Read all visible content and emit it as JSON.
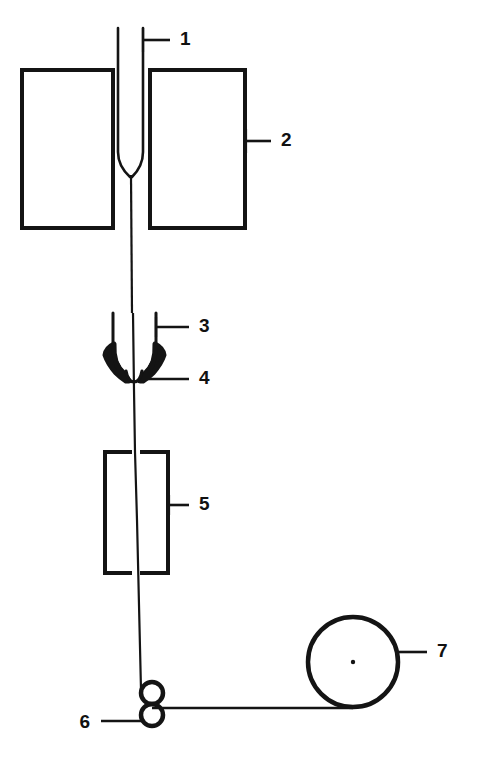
{
  "figure": {
    "background_color": "#ffffff",
    "stroke_color": "#141414",
    "fill_color": "#141414",
    "width": 477,
    "height": 763
  },
  "callouts": [
    {
      "id": "callout-1",
      "label": "1",
      "name": "spinneret-capillary-callout",
      "text_x": 180,
      "text_y": 40,
      "leader_x1": 143,
      "leader_y1": 40,
      "leader_x2": 170,
      "leader_y2": 40,
      "tick_x": 143,
      "tick_y1": 28,
      "tick_y2": 52,
      "has_tick": true
    },
    {
      "id": "callout-2",
      "label": "2",
      "name": "heated-block-callout",
      "text_x": 281,
      "text_y": 141,
      "leader_x1": 246,
      "leader_y1": 141,
      "leader_x2": 271,
      "leader_y2": 141,
      "tick_x": 246,
      "tick_y1": 129,
      "tick_y2": 153,
      "has_tick": true
    },
    {
      "id": "callout-3",
      "label": "3",
      "name": "quench-guide-callout",
      "text_x": 199,
      "text_y": 327,
      "leader_x1": 156,
      "leader_y1": 327,
      "leader_x2": 189,
      "leader_y2": 327,
      "tick_x": 156,
      "tick_y1": 317,
      "tick_y2": 337,
      "has_tick": true
    },
    {
      "id": "callout-4",
      "label": "4",
      "name": "convergence-point-callout",
      "text_x": 199,
      "text_y": 379,
      "leader_x1": 147,
      "leader_y1": 379,
      "leader_x2": 189,
      "leader_y2": 379,
      "tick_x": 0,
      "tick_y1": 0,
      "tick_y2": 0,
      "has_tick": false
    },
    {
      "id": "callout-5",
      "label": "5",
      "name": "drawing-chamber-callout",
      "text_x": 199,
      "text_y": 505,
      "leader_x1": 169,
      "leader_y1": 505,
      "leader_x2": 189,
      "leader_y2": 505,
      "tick_x": 169,
      "tick_y1": 495,
      "tick_y2": 515,
      "has_tick": true
    },
    {
      "id": "callout-6",
      "label": "6",
      "name": "nip-rollers-callout",
      "text_x": 90,
      "text_y": 723,
      "leader_x1": 101,
      "leader_y1": 721,
      "leader_x2": 142,
      "leader_y2": 721,
      "tick_x": 0,
      "tick_y1": 0,
      "tick_y2": 0,
      "has_tick": false
    },
    {
      "id": "callout-7",
      "label": "7",
      "name": "take-up-roll-callout",
      "text_x": 437,
      "text_y": 652,
      "leader_x1": 399,
      "leader_y1": 652,
      "leader_x2": 427,
      "leader_y2": 652,
      "tick_x": 0,
      "tick_y1": 0,
      "tick_y2": 0,
      "has_tick": false
    }
  ],
  "geometry": {
    "left_block": {
      "x": 22,
      "y": 70,
      "width": 91,
      "height": 158
    },
    "right_block": {
      "x": 150,
      "y": 70,
      "width": 95,
      "height": 158
    },
    "capillary_left_x": 118,
    "capillary_right_x": 143,
    "capillary_top_y": 28,
    "capillary_taper_y": 152,
    "capillary_tip_y": 175,
    "filament_x_top": 131,
    "filament_x_mid": 133,
    "filament_x_bottom": 141,
    "guide_left_x": 113,
    "guide_right_x": 156,
    "guide_top_y": 313,
    "guide_tip_y": 381,
    "chamber_left": {
      "x": 105,
      "y": 452,
      "width": 27,
      "height": 121
    },
    "chamber_right": {
      "x": 140,
      "y": 452,
      "width": 28,
      "height": 121
    },
    "roller_upper": {
      "cx": 152,
      "cy": 693,
      "r": 11
    },
    "roller_lower": {
      "cx": 152,
      "cy": 715,
      "r": 11
    },
    "takeup_roll": {
      "cx": 353,
      "cy": 662,
      "r": 45
    },
    "takeup_hub": {
      "cx": 353,
      "cy": 662,
      "r": 2
    },
    "transport_line_y": 708,
    "transport_line_x1": 152,
    "transport_line_x2": 353
  }
}
